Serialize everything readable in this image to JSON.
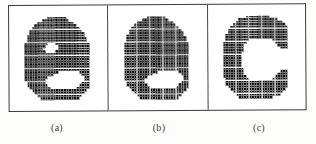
{
  "figure": {
    "title": "",
    "background_color": "#ffffff",
    "ink_color": "#111111",
    "border_color": "#3b3b3b",
    "panel_count": 3
  },
  "captions": {
    "a": "(a)",
    "b": "(b)",
    "c": "(c)"
  },
  "panels": [
    {
      "id": "a",
      "caption": "(a)",
      "glyph": "e",
      "description": "original binary letter e with aperture hole",
      "cell_size": 2.6,
      "cols": 26,
      "rows": 32,
      "bitmap": [
        "00000000011111110000000000",
        "00000001111111111000000000",
        "00000111111111111110000000",
        "00001111111111111111000000",
        "00011111111111111111100000",
        "00111111111111111111110000",
        "00111111111111111111111000",
        "01111111111111111111111000",
        "01111111111111111111111100",
        "01111111111111111111111100",
        "11111111100011111111111110",
        "11111111000001111111111110",
        "11111110000001111111111110",
        "11111111000011111111111110",
        "11111111111111111111111110",
        "11111111111111111111111110",
        "11111111111111111111111110",
        "11111111111111111111111110",
        "11111111111111111111111110",
        "11111111111111111111111110",
        "11111111111111111111111110",
        "11111111111110000000011110",
        "11111111111000000000001110",
        "11111111100000000000000110",
        "11111111000000000000000110",
        "01111111000000000000001110",
        "01111111100000000000011110",
        "00111111110000000000111110",
        "00011111111111111111111100",
        "00001111111111111111111000",
        "00000111111111111111110000",
        "00000011111111111111100000"
      ]
    },
    {
      "id": "b",
      "caption": "(b)",
      "glyph": "e",
      "description": "letter e after hole filling - aperture removed",
      "cell_size": 2.6,
      "cols": 26,
      "rows": 32,
      "bitmap": [
        "00000000011111110000000000",
        "00000001111111111000000000",
        "00000111111111111110000000",
        "00001111111111111111000000",
        "00011111111111111111100000",
        "00111111111111111111110000",
        "00111111111111111111111000",
        "01111111111111111111111000",
        "01111111111111111111111100",
        "01111111111111111111111100",
        "11111111111111111111111110",
        "11111111111111111111111110",
        "11111111111111111111111110",
        "11111111111111111111111110",
        "11111111111111111111111110",
        "11111111111111111111111110",
        "11111111111111111111111110",
        "11111111111111111111111110",
        "11111111111111111111111110",
        "11111111111111111111111110",
        "11111111111111111111111110",
        "11111111111110000000011110",
        "11111111111000000000001110",
        "11111111100000000000000110",
        "11111111000000000000000110",
        "01111111000000000000001110",
        "01111111100000000000011110",
        "00111111110000000000111110",
        "00011111111111111111111100",
        "00001111111111111111111000",
        "00000111111111111111110000",
        "00000011111111111111100000"
      ]
    },
    {
      "id": "c",
      "caption": "(c)",
      "glyph": "c",
      "description": "letter c - horizontal bar of e removed by opening",
      "cell_size": 2.6,
      "cols": 26,
      "rows": 32,
      "bitmap": [
        "00000000011111111100000000",
        "00000011111111111111100000",
        "00000111111111111111111000",
        "00001111111111111111111100",
        "00011111111111111111111110",
        "00111111111111111111111110",
        "00111111111111111111111110",
        "01111111111111111111111110",
        "01111111111111111111111110",
        "01111111110000000001111110",
        "11111111100000000000111110",
        "11111111000000000000011110",
        "11111111000000000000001110",
        "11111111000000000000000000",
        "11111110000000000000000000",
        "11111110000000000000000000",
        "11111110000000000000000000",
        "11111110000000000000000000",
        "11111110000000000000000000",
        "11111110000000000000000000",
        "11111111000000000000000000",
        "11111111000000000000001110",
        "11111111000000000000011110",
        "11111111100000000000111110",
        "01111111110000000001111110",
        "01111111111111111111111110",
        "01111111111111111111111110",
        "00111111111111111111111110",
        "00011111111111111111111100",
        "00001111111111111111111000",
        "00000111111111111111110000",
        "00000011111111111110000000"
      ]
    }
  ]
}
